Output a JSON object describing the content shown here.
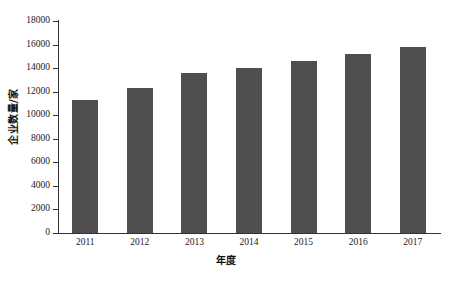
{
  "chart_data": {
    "type": "bar",
    "title": "",
    "subtitle": "",
    "xlabel": "年度",
    "ylabel": "企业数量/家",
    "categories": [
      "2011",
      "2012",
      "2013",
      "2014",
      "2015",
      "2016",
      "2017"
    ],
    "values": [
      11300,
      12300,
      13600,
      14000,
      14600,
      15200,
      15800
    ],
    "series": [
      {
        "name": "企业数量",
        "values": [
          11300,
          12300,
          13600,
          14000,
          14600,
          15200,
          15800
        ]
      }
    ],
    "ylim": [
      0,
      18000
    ],
    "ytick_values": [
      0,
      2000,
      4000,
      6000,
      8000,
      10000,
      12000,
      14000,
      16000,
      18000
    ],
    "ytick_labels": [
      "0",
      "2000",
      "4000",
      "6000",
      "8000",
      "10000",
      "12000",
      "14000",
      "16000",
      "18000"
    ],
    "xtick_labels": [
      "2011",
      "2012",
      "2013",
      "2014",
      "2015",
      "2016",
      "2017"
    ],
    "grid": false,
    "legend": null,
    "legend_position": "none",
    "bar_color": "#4f4f4f",
    "axis_color": "#333333",
    "background_color": "#ffffff",
    "annotations": []
  },
  "caption": {
    "partial_text": ""
  }
}
